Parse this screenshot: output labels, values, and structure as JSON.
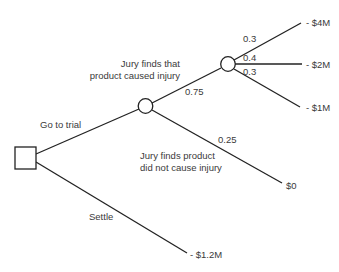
{
  "diagram": {
    "type": "decision-tree",
    "nodes": {
      "decision": {
        "kind": "decision"
      },
      "chance_trial": {
        "kind": "chance"
      },
      "chance_damages": {
        "kind": "chance"
      }
    },
    "branches": {
      "go_to_trial": {
        "label": "Go to trial"
      },
      "settle": {
        "label": "Settle",
        "payoff": "- $1.2M"
      },
      "injury": {
        "label_line1": "Jury finds that",
        "label_line2": "product caused injury",
        "probability": "0.75"
      },
      "no_injury": {
        "label_line1": "Jury finds product",
        "label_line2": "did not cause injury",
        "probability": "0.25",
        "payoff": "$0"
      },
      "damages_high": {
        "probability": "0.3",
        "payoff": "- $4M"
      },
      "damages_mid": {
        "probability": "0.4",
        "payoff": "- $2M"
      },
      "damages_low": {
        "probability": "0.3",
        "payoff": "- $1M"
      }
    }
  }
}
